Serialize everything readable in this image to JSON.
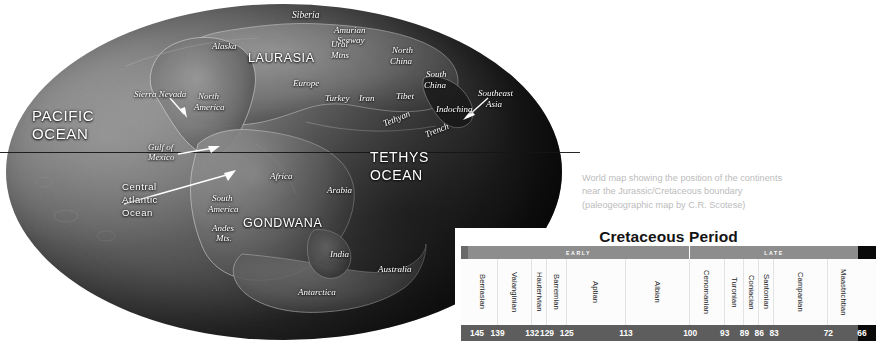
{
  "map": {
    "caption": [
      "World map showing the position of the continents",
      "near the Jurassic/Cretaceous boundary",
      "(paleogeographic map by C.R. Scotese)"
    ],
    "labels": [
      {
        "text": "PACIFIC",
        "x": 32,
        "y": 108,
        "size": 15,
        "style": "sans-cap"
      },
      {
        "text": "OCEAN",
        "x": 32,
        "y": 126,
        "size": 15,
        "style": "sans-cap"
      },
      {
        "text": "TETHYS",
        "x": 370,
        "y": 150,
        "size": 14,
        "style": "sans-cap"
      },
      {
        "text": "OCEAN",
        "x": 370,
        "y": 168,
        "size": 14,
        "style": "sans-cap"
      },
      {
        "text": "LAURASIA",
        "x": 248,
        "y": 52,
        "size": 12.5,
        "style": "sans-cap"
      },
      {
        "text": "GONDWANA",
        "x": 243,
        "y": 217,
        "size": 12.5,
        "style": "sans-cap"
      },
      {
        "text": "Siberia",
        "x": 292,
        "y": 10,
        "size": 9.5,
        "style": "serif-it"
      },
      {
        "text": "Amurian",
        "x": 334,
        "y": 26,
        "size": 9,
        "style": "serif-it"
      },
      {
        "text": "Seaway",
        "x": 337,
        "y": 36,
        "size": 9,
        "style": "serif-it"
      },
      {
        "text": "Ural",
        "x": 331,
        "y": 40,
        "size": 9,
        "style": "serif-it"
      },
      {
        "text": "Mtns",
        "x": 331,
        "y": 51,
        "size": 9,
        "style": "serif-it"
      },
      {
        "text": "North",
        "x": 392,
        "y": 46,
        "size": 9,
        "style": "serif-it"
      },
      {
        "text": "China",
        "x": 390,
        "y": 57,
        "size": 9,
        "style": "serif-it"
      },
      {
        "text": "South",
        "x": 426,
        "y": 70,
        "size": 9,
        "style": "serif-it"
      },
      {
        "text": "China",
        "x": 424,
        "y": 81,
        "size": 9,
        "style": "serif-it"
      },
      {
        "text": "Southeast",
        "x": 478,
        "y": 89,
        "size": 9,
        "style": "serif-it"
      },
      {
        "text": "Asia",
        "x": 486,
        "y": 100,
        "size": 9,
        "style": "serif-it"
      },
      {
        "text": "Indochina",
        "x": 436,
        "y": 105,
        "size": 9,
        "style": "serif-it"
      },
      {
        "text": "Tibet",
        "x": 396,
        "y": 92,
        "size": 9,
        "style": "serif-it"
      },
      {
        "text": "Iran",
        "x": 359,
        "y": 94,
        "size": 9,
        "style": "serif-it"
      },
      {
        "text": "Turkey",
        "x": 325,
        "y": 94,
        "size": 9,
        "style": "serif-it"
      },
      {
        "text": "Europe",
        "x": 293,
        "y": 79,
        "size": 9,
        "style": "serif-it"
      },
      {
        "text": "Alaska",
        "x": 212,
        "y": 42,
        "size": 9,
        "style": "serif-it"
      },
      {
        "text": "North",
        "x": 198,
        "y": 92,
        "size": 9,
        "style": "serif-it"
      },
      {
        "text": "America",
        "x": 194,
        "y": 103,
        "size": 9,
        "style": "serif-it"
      },
      {
        "text": "Sierra Nevada",
        "x": 134,
        "y": 90,
        "size": 9,
        "style": "serif-it"
      },
      {
        "text": "Gulf of",
        "x": 148,
        "y": 143,
        "size": 9,
        "style": "serif-it"
      },
      {
        "text": "Mexico",
        "x": 148,
        "y": 153,
        "size": 9,
        "style": "serif-it"
      },
      {
        "text": "Central",
        "x": 122,
        "y": 182,
        "size": 9.5,
        "style": "sans-cap"
      },
      {
        "text": "Atlantic",
        "x": 122,
        "y": 195,
        "size": 9.5,
        "style": "sans-cap"
      },
      {
        "text": "Ocean",
        "x": 122,
        "y": 208,
        "size": 9.5,
        "style": "sans-cap"
      },
      {
        "text": "South",
        "x": 212,
        "y": 194,
        "size": 9,
        "style": "serif-it"
      },
      {
        "text": "America",
        "x": 208,
        "y": 205,
        "size": 9,
        "style": "serif-it"
      },
      {
        "text": "Andes",
        "x": 212,
        "y": 224,
        "size": 9,
        "style": "serif-it"
      },
      {
        "text": "Mts.",
        "x": 216,
        "y": 234,
        "size": 9,
        "style": "serif-it"
      },
      {
        "text": "Africa",
        "x": 270,
        "y": 172,
        "size": 9,
        "style": "serif-it"
      },
      {
        "text": "Arabia",
        "x": 327,
        "y": 186,
        "size": 9,
        "style": "serif-it"
      },
      {
        "text": "India",
        "x": 330,
        "y": 250,
        "size": 9,
        "style": "serif-it"
      },
      {
        "text": "Australia",
        "x": 378,
        "y": 265,
        "size": 9,
        "style": "serif-it"
      },
      {
        "text": "Antarctica",
        "x": 298,
        "y": 288,
        "size": 9,
        "style": "serif-it"
      },
      {
        "text": "Tethyan",
        "x": 382,
        "y": 120,
        "size": 9,
        "style": "serif-it",
        "rot": -22
      },
      {
        "text": "Trench",
        "x": 424,
        "y": 131,
        "size": 9,
        "style": "serif-it",
        "rot": -22
      }
    ]
  },
  "chart_data": {
    "type": "table",
    "title": "Cretaceous Period",
    "xlabel": "Millions of years ago (Ma)",
    "axis_direction": "oldest-left",
    "epochs": [
      {
        "label": "EARLY",
        "start": 145,
        "end": 100
      },
      {
        "label": "LATE",
        "start": 100,
        "end": 66
      }
    ],
    "categories": [
      "Berriasian",
      "Valanginian",
      "Hauterivian",
      "Barremian",
      "Aptian",
      "Albian",
      "Cenomanian",
      "Turonian",
      "Coniacian",
      "Santonian",
      "Campanian",
      "Maastrichtian"
    ],
    "stage_boundaries": [
      145,
      139,
      132,
      129,
      125,
      113,
      100,
      93,
      89,
      86,
      83,
      72,
      66
    ],
    "stage_spans": [
      {
        "stage": "Berriasian",
        "from": 145,
        "to": 139,
        "epoch": "EARLY"
      },
      {
        "stage": "Valanginian",
        "from": 139,
        "to": 132,
        "epoch": "EARLY"
      },
      {
        "stage": "Hauterivian",
        "from": 132,
        "to": 129,
        "epoch": "EARLY"
      },
      {
        "stage": "Barremian",
        "from": 129,
        "to": 125,
        "epoch": "EARLY"
      },
      {
        "stage": "Aptian",
        "from": 125,
        "to": 113,
        "epoch": "EARLY"
      },
      {
        "stage": "Albian",
        "from": 113,
        "to": 100,
        "epoch": "EARLY"
      },
      {
        "stage": "Cenomanian",
        "from": 100,
        "to": 93,
        "epoch": "LATE"
      },
      {
        "stage": "Turonian",
        "from": 93,
        "to": 89,
        "epoch": "LATE"
      },
      {
        "stage": "Coniacian",
        "from": 89,
        "to": 86,
        "epoch": "LATE"
      },
      {
        "stage": "Santonian",
        "from": 86,
        "to": 83,
        "epoch": "LATE"
      },
      {
        "stage": "Campanian",
        "from": 83,
        "to": 72,
        "epoch": "LATE"
      },
      {
        "stage": "Maastrichtian",
        "from": 72,
        "to": 66,
        "epoch": "LATE"
      }
    ],
    "xlim": [
      145,
      66
    ],
    "colors": {
      "epoch_band": "#8d8d8d",
      "epoch_cap": "#6a6a6a",
      "age_band": "#5d5d5d",
      "end_marker": "#0a0a0a",
      "text": "#ffffff"
    }
  }
}
